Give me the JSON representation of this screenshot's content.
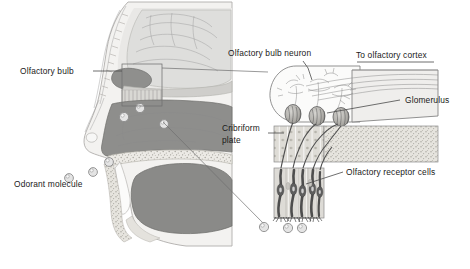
{
  "figure": {
    "width": 470,
    "height": 269,
    "background": "#ffffff"
  },
  "labels": {
    "olfactory_bulb": "Olfactory bulb",
    "odorant_molecule": "Odorant molecule",
    "olfactory_bulb_neuron": "Olfactory bulb neuron",
    "to_olfactory_cortex": "To olfactory cortex",
    "glomerulus": "Glomerulus",
    "cribriform_plate_line1": "Cribriform",
    "cribriform_plate_line2": "plate",
    "olfactory_receptor_cells": "Olfactory receptor cells"
  },
  "colors": {
    "ink": "#1a1a1a",
    "leader": "#4a4a4a",
    "hairline": "#8a8a8a",
    "brain_tissue": "#d8d8d6",
    "nasal_mucosa": "#8d8d8d",
    "soft_tissue": "#efeeec",
    "skin_outline": "#a8a8a8",
    "tongue_dark": "#7c7c7c",
    "bone_speckle": "#e8e7e3",
    "receptor_cell": "#6d6d6d",
    "epithelium_bg": "#dedcd8",
    "glomerulus_fill": "#bdbdbd",
    "odorant_fill": "#e4e4e4",
    "background": "#ffffff"
  },
  "regions": {
    "sagittal_head": "left sagittal section of human head showing nasal cavity, brain, palate and tongue",
    "inset_panel": "magnified olfactory bulb, cribriform plate and olfactory epithelium"
  },
  "counts": {
    "odorant_molecules_nasal": 4,
    "odorant_molecules_inset": 3,
    "glomeruli": 3,
    "receptor_cell_columns": 5
  }
}
